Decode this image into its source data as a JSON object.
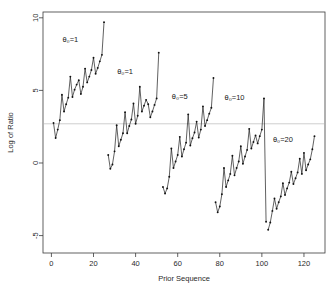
{
  "chart_data": {
    "type": "line",
    "title": "",
    "xlabel": "Prior Sequence",
    "ylabel": "Log of Ratio",
    "xlim": [
      -4,
      130
    ],
    "ylim": [
      -6.2,
      10.4
    ],
    "xticks": [
      0,
      20,
      40,
      60,
      80,
      100,
      120
    ],
    "xtick_labels": [
      "0",
      "20",
      "40",
      "60",
      "80",
      "100",
      "120"
    ],
    "yticks": [
      10,
      5,
      0,
      -5
    ],
    "ytick_labels": [
      "10",
      "5",
      "0",
      "-5"
    ],
    "grid": false,
    "legend": "none",
    "reference_line": {
      "orientation": "horizontal",
      "y": 2.7,
      "color": "#c2c2c2"
    },
    "annotations": [
      {
        "text": "θ₀=1",
        "x": 9,
        "y": 8.3
      },
      {
        "text": "θ₀=1",
        "x": 35,
        "y": 6.1
      },
      {
        "text": "θ₀=5",
        "x": 61,
        "y": 4.4
      },
      {
        "text": "θ₀=10",
        "x": 87,
        "y": 4.35
      },
      {
        "text": "θ₀=20",
        "x": 110,
        "y": 1.45
      }
    ],
    "series": [
      {
        "name": "θ₀=1 block A",
        "x": [
          1,
          2,
          3,
          4,
          5,
          6,
          7,
          8,
          9,
          10,
          11,
          12,
          13,
          14,
          15,
          16,
          17,
          18,
          19,
          20,
          21,
          22,
          23,
          24,
          25
        ],
        "values": [
          2.75,
          1.72,
          2.3,
          2.95,
          4.7,
          3.55,
          4.05,
          4.5,
          5.95,
          4.55,
          5.05,
          5.4,
          5.7,
          4.75,
          5.25,
          6.5,
          5.55,
          5.95,
          6.4,
          7.25,
          6.15,
          6.55,
          7.0,
          7.45,
          9.7
        ]
      },
      {
        "name": "θ₀=1 block B",
        "x": [
          27,
          28,
          29,
          30,
          31,
          32,
          33,
          34,
          35,
          36,
          37,
          38,
          39,
          40,
          41,
          42,
          43,
          44,
          45,
          46,
          47,
          48,
          49,
          50,
          51
        ],
        "values": [
          0.55,
          -0.4,
          -0.1,
          0.8,
          2.6,
          1.15,
          1.6,
          2.05,
          3.5,
          2.05,
          2.55,
          3.0,
          4.1,
          2.7,
          3.25,
          5.25,
          3.55,
          3.95,
          4.35,
          4.05,
          3.15,
          3.55,
          4.0,
          4.45,
          7.6
        ]
      },
      {
        "name": "θ₀=5 block",
        "x": [
          53,
          54,
          55,
          56,
          57,
          58,
          59,
          60,
          61,
          62,
          63,
          64,
          65,
          66,
          67,
          68,
          69,
          70,
          71,
          72,
          73,
          74,
          75,
          76,
          77
        ],
        "values": [
          -1.65,
          -2.1,
          -1.75,
          -0.95,
          1.0,
          -0.35,
          0.1,
          0.55,
          1.8,
          0.45,
          0.95,
          1.4,
          3.35,
          1.2,
          1.7,
          2.1,
          2.85,
          1.75,
          2.3,
          3.9,
          2.55,
          2.95,
          3.4,
          3.8,
          5.85
        ]
      },
      {
        "name": "θ₀=10 block",
        "x": [
          78,
          79,
          80,
          81,
          82,
          83,
          84,
          85,
          86,
          87,
          88,
          89,
          90,
          91,
          92,
          93,
          94,
          95,
          96,
          97,
          98,
          99,
          100,
          101,
          102
        ],
        "values": [
          -2.7,
          -3.4,
          -3.0,
          -2.15,
          -0.35,
          -1.65,
          -1.2,
          -0.75,
          0.5,
          -0.85,
          -0.35,
          0.1,
          1.15,
          -0.05,
          0.45,
          0.9,
          2.35,
          1.0,
          1.45,
          1.9,
          1.35,
          1.85,
          2.3,
          4.45,
          -4.05
        ]
      },
      {
        "name": "θ₀=20 block",
        "x": [
          103,
          104,
          105,
          106,
          107,
          108,
          109,
          110,
          111,
          112,
          113,
          114,
          115,
          116,
          117,
          118,
          119,
          120,
          121,
          122,
          123,
          124,
          125
        ],
        "values": [
          -4.6,
          -4.1,
          -3.3,
          -2.45,
          -3.15,
          -2.7,
          -2.3,
          -1.4,
          -2.2,
          -1.75,
          -1.35,
          -0.6,
          -1.45,
          -1.05,
          -0.65,
          0.3,
          -0.75,
          0.7,
          -0.5,
          -0.1,
          0.25,
          0.95,
          1.85
        ]
      }
    ]
  },
  "axes": {
    "x_title": "Prior Sequence",
    "y_title": "Log of Ratio"
  }
}
